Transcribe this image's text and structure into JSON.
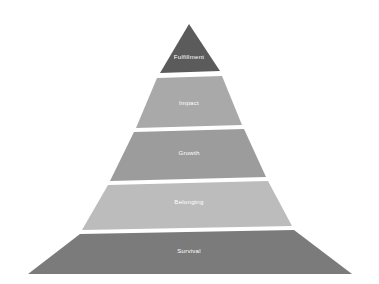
{
  "figure": {
    "type": "pyramid",
    "title": "",
    "background_color": "#ffffff",
    "label_color": "#ffffff",
    "tier_count": 5,
    "orientation": "apex-top"
  },
  "chart_data": {
    "type": "pie",
    "title": "",
    "xlabel": "",
    "ylabel": "",
    "categories": [
      "Fulfillment",
      "Impact",
      "Growth",
      "Belonging",
      "Survival"
    ],
    "values": [
      1,
      2,
      3,
      4,
      5
    ],
    "legend_position": "none",
    "grid": false
  },
  "tiers": [
    {
      "index": 1,
      "label": "Fulfillment",
      "color": "#5b5b5b",
      "level": "top",
      "font_size": 6.2,
      "label_x": 189,
      "label_y": 57,
      "points": "189,24 160,73 220,71"
    },
    {
      "index": 2,
      "label": "Impact",
      "color": "#a9a9a9",
      "level": "second",
      "font_size": 6.2,
      "label_x": 189,
      "label_y": 103,
      "points": "157,78 222,76 242,125 136,128"
    },
    {
      "index": 3,
      "label": "Growth",
      "color": "#9c9c9c",
      "level": "middle",
      "font_size": 6.2,
      "label_x": 189,
      "label_y": 153,
      "points": "134,132 244,129 266,177 110,181"
    },
    {
      "index": 4,
      "label": "Belonging",
      "color": "#bcbcbc",
      "level": "fourth",
      "font_size": 6.2,
      "label_x": 189,
      "label_y": 202,
      "points": "108,185 268,181 292,226 82,230"
    },
    {
      "index": 5,
      "label": "Survival",
      "color": "#7b7b7b",
      "level": "base",
      "font_size": 6.2,
      "label_x": 189,
      "label_y": 251,
      "points": "80,234 294,230 352,274 28,274"
    }
  ]
}
